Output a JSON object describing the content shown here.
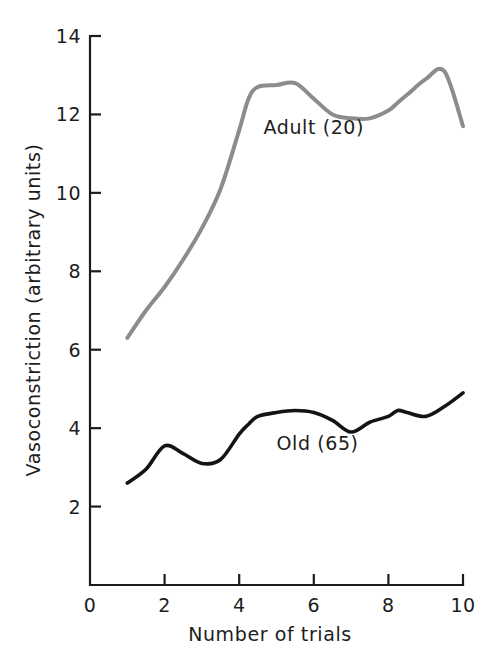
{
  "chart_data": {
    "type": "line",
    "title": "",
    "subtitle": "",
    "xlabel": "Number of trials",
    "ylabel": "Vasoconstriction (arbitrary units)",
    "xlim": [
      0,
      10
    ],
    "ylim": [
      0,
      14
    ],
    "x_ticks": [
      0,
      2,
      4,
      6,
      8,
      10
    ],
    "x_tick_labels": [
      "0",
      "2",
      "4",
      "6",
      "8",
      "10"
    ],
    "x_minor_ticks": [
      1,
      3,
      5,
      7,
      9
    ],
    "y_ticks": [
      2,
      4,
      6,
      8,
      10,
      12,
      14
    ],
    "y_tick_labels": [
      "2",
      "4",
      "6",
      "8",
      "10",
      "12",
      "14"
    ],
    "grid": false,
    "legend_position": "inline-annotation",
    "x": [
      1,
      1.5,
      2,
      2.5,
      3,
      3.5,
      4,
      4.25,
      4.5,
      5,
      5.5,
      6,
      6.5,
      7,
      7.5,
      8,
      8.25,
      8.5,
      9,
      9.5,
      10
    ],
    "series": [
      {
        "name": "Adult (20)",
        "color": "#8c8c8c",
        "label_x": 6.0,
        "label_y": 11.5,
        "values": [
          6.3,
          7.0,
          7.6,
          8.3,
          9.1,
          10.1,
          11.6,
          12.4,
          12.7,
          12.75,
          12.8,
          12.4,
          12.0,
          11.9,
          11.9,
          12.1,
          12.3,
          12.5,
          12.9,
          13.1,
          11.7
        ]
      },
      {
        "name": "Old (65)",
        "color": "#141414",
        "label_x": 6.1,
        "label_y": 3.45,
        "values": [
          2.6,
          2.95,
          3.55,
          3.35,
          3.1,
          3.2,
          3.85,
          4.1,
          4.3,
          4.4,
          4.45,
          4.4,
          4.2,
          3.9,
          4.15,
          4.3,
          4.45,
          4.4,
          4.3,
          4.55,
          4.9
        ]
      }
    ],
    "annotations": [
      {
        "text": "Adult (20)",
        "series": "Adult (20)",
        "x": 6.0,
        "y": 11.5
      },
      {
        "text": "Old (65)",
        "series": "Old (65)",
        "x": 6.1,
        "y": 3.45
      }
    ]
  },
  "figure": {
    "background_color": "#ffffff",
    "axis_color": "#1d1d1d",
    "plot_area": {
      "left": 90,
      "right": 463,
      "top": 36,
      "bottom": 585
    }
  }
}
